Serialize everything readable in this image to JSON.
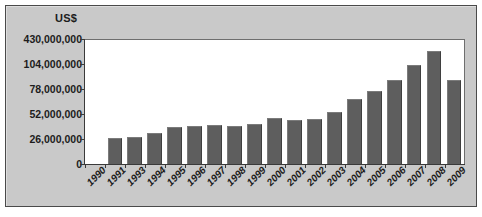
{
  "figure": {
    "unit_label": "US$",
    "background_color": "#c9c9c9",
    "plot_background_color": "#ffffff",
    "bar_color": "#5e5e5e",
    "axis_color": "#3a3a3a"
  },
  "chart_data": {
    "type": "bar",
    "title": "",
    "subtitle": "",
    "xlabel": "",
    "ylabel": "US$",
    "grid": false,
    "legend": null,
    "legend_position": "none",
    "categories": [
      "1990",
      "1991",
      "1993",
      "1994",
      "1995",
      "1996",
      "1997",
      "1998",
      "1999",
      "2000",
      "2001",
      "2002",
      "2003",
      "2004",
      "2005",
      "2006",
      "2007",
      "2008",
      "2009"
    ],
    "values": [
      0,
      27000000,
      28500000,
      32000000,
      39000000,
      40000000,
      41000000,
      40000000,
      41500000,
      48000000,
      46000000,
      47500000,
      55000000,
      68000000,
      77000000,
      88000000,
      104000000,
      118000000,
      88000000
    ],
    "ytick_labels": [
      "430,000,000",
      "104,000,000",
      "78,000,000",
      "52,000,000",
      "26,000,000",
      "0"
    ],
    "ytick_values": [
      430000000,
      104000000,
      78000000,
      52000000,
      26000000,
      0
    ],
    "ytick_positions_pct": [
      100,
      80,
      60,
      40,
      20,
      0
    ],
    "ylim": [
      0,
      130000000
    ]
  }
}
